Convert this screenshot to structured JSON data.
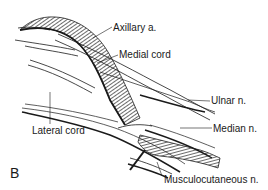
{
  "figure": {
    "panel_letter": "B",
    "labels": {
      "axillary_artery": "Axillary a.",
      "medial_cord": "Medial cord",
      "lateral_cord": "Lateral cord",
      "ulnar_nerve": "Ulnar n.",
      "median_nerve": "Median n.",
      "musculocutaneous_nerve": "Musculocutaneous n."
    },
    "colors": {
      "line": "#1a1a1a",
      "background": "#ffffff"
    }
  }
}
